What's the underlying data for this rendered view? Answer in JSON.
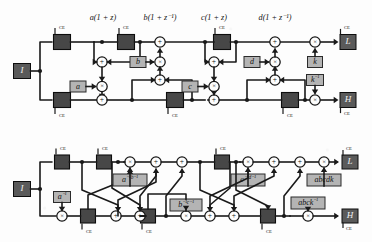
{
  "figure": {
    "colors": {
      "wire": "#1a1a1a",
      "dark_register": "#474747",
      "dark_register_stroke": "#0d0d0d",
      "coef_box": "#b4b4b4",
      "coef_box_stroke": "#2b2b2b",
      "io_box": "#5a5a5a",
      "node_fill": "#fdfdfd",
      "node_stroke": "#141414",
      "background": "#fdfdfd",
      "text_dark": "#111111",
      "text_light": "#f2f2f2"
    },
    "glyphs": {
      "adder": "+",
      "multiplier": "×",
      "ce_label": "CE"
    }
  },
  "top_diagram": {
    "name": "analysis-lifting-network",
    "stage_labels": [
      {
        "id": "stage-a",
        "text": "a(1 + z)"
      },
      {
        "id": "stage-b",
        "text": "b(1 + z⁻¹)"
      },
      {
        "id": "stage-c",
        "text": "c(1 + z)"
      },
      {
        "id": "stage-d",
        "text": "d(1 + z⁻¹)"
      }
    ],
    "input": {
      "id": "input-I",
      "text": "I"
    },
    "outputs": [
      {
        "id": "output-L",
        "text": "L"
      },
      {
        "id": "output-H",
        "text": "H"
      }
    ],
    "coefficients": [
      {
        "id": "coef-a",
        "text": "a"
      },
      {
        "id": "coef-b",
        "text": "b"
      },
      {
        "id": "coef-c",
        "text": "c"
      },
      {
        "id": "coef-d",
        "text": "d"
      },
      {
        "id": "coef-k",
        "text": "k"
      },
      {
        "id": "coef-k-inv",
        "text": "k⁻¹"
      }
    ],
    "register_count": 7,
    "adder_count": 10,
    "multiplier_count": 6,
    "ce_tag": "CE"
  },
  "bottom_diagram": {
    "name": "factored-lifting-network",
    "input": {
      "id": "input-I",
      "text": "I"
    },
    "outputs": [
      {
        "id": "output-L",
        "text": "L"
      },
      {
        "id": "output-H",
        "text": "H"
      }
    ],
    "coefficients": [
      {
        "id": "coef-a-inv",
        "text": "a⁻¹"
      },
      {
        "id": "coef-ainv-binv",
        "text": "a⁻¹b⁻¹"
      },
      {
        "id": "coef-binv-cinv",
        "text": "b⁻¹c⁻¹"
      },
      {
        "id": "coef-cinv-dinv",
        "text": "c⁻¹d⁻¹"
      },
      {
        "id": "coef-abcdk",
        "text": "abcdk"
      },
      {
        "id": "coef-abck-inv",
        "text": "abck⁻¹"
      }
    ],
    "register_count": 8,
    "adder_count": 8,
    "multiplier_count": 6,
    "ce_tag": "CE"
  }
}
